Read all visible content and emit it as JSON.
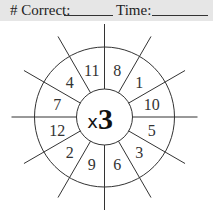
{
  "header": {
    "correct_label": "# Correct:",
    "time_label": "Time:",
    "background": "#e6e6e6"
  },
  "wheel": {
    "multiplier_symbol": "x",
    "multiplier_value": "3",
    "numbers_clockwise_from_top": [
      "8",
      "1",
      "10",
      "5",
      "3",
      "6",
      "9",
      "2",
      "12",
      "7",
      "4",
      "11"
    ],
    "segments": 12,
    "line_color": "#333333"
  }
}
